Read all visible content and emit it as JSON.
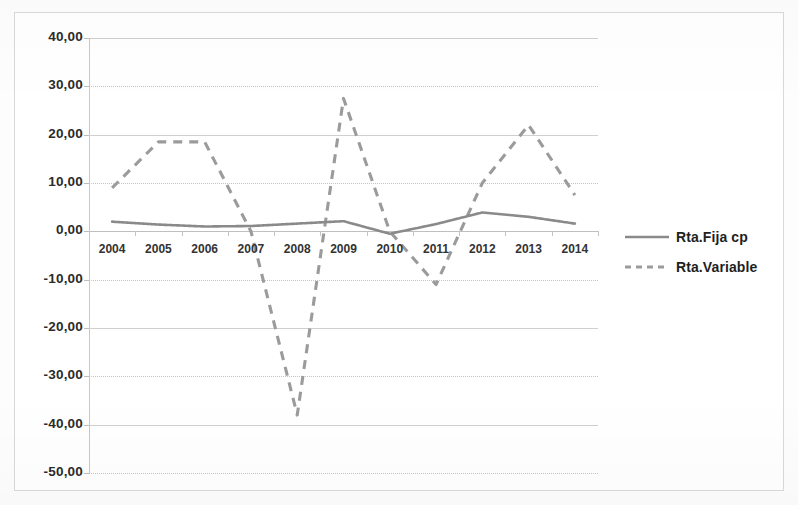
{
  "chart_data": {
    "type": "line",
    "title": "",
    "subtitle": "",
    "xlabel": "",
    "ylabel": "",
    "categories": [
      "2004",
      "2005",
      "2006",
      "2007",
      "2008",
      "2009",
      "2010",
      "2011",
      "2012",
      "2013",
      "2014"
    ],
    "ylim": [
      -50,
      40
    ],
    "ytick_labels": [
      "40,00",
      "30,00",
      "20,00",
      "10,00",
      "0,00",
      "-10,00",
      "-20,00",
      "-30,00",
      "-40,00",
      "-50,00"
    ],
    "ytick_values": [
      40,
      30,
      20,
      10,
      0,
      -10,
      -20,
      -30,
      -40,
      -50
    ],
    "grid": true,
    "legend_position": "right",
    "series": [
      {
        "name": "Rta.Fija cp",
        "style": "dotted-solid",
        "color": "#808080",
        "values": [
          2.0,
          1.4,
          1.0,
          1.1,
          1.6,
          2.1,
          -0.5,
          1.5,
          3.9,
          3.0,
          1.6
        ]
      },
      {
        "name": "Rta.Variable",
        "style": "dashed",
        "color": "#999999",
        "values": [
          9.0,
          18.5,
          18.5,
          0.0,
          -38.0,
          27.5,
          0.0,
          -11.0,
          10.0,
          22.0,
          7.5
        ]
      }
    ]
  },
  "legend": {
    "entries": [
      {
        "label": "Rta.Fija cp"
      },
      {
        "label": "Rta.Variable"
      }
    ]
  },
  "colors": {
    "series_fija": "#808080",
    "series_variable": "#9b9b9b",
    "gridline": "#cfcfcf",
    "frame": "#d9d9d9",
    "text": "#2b2b2b"
  }
}
